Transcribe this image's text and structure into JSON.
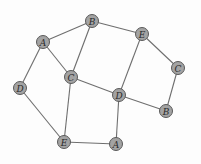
{
  "graph": {
    "nodes": [
      {
        "id": "n1",
        "label": "A",
        "x": 43,
        "y": 42
      },
      {
        "id": "n2",
        "label": "B",
        "x": 92,
        "y": 21
      },
      {
        "id": "n3",
        "label": "E",
        "x": 142,
        "y": 34
      },
      {
        "id": "n4",
        "label": "C",
        "x": 178,
        "y": 68
      },
      {
        "id": "n5",
        "label": "C",
        "x": 71,
        "y": 77
      },
      {
        "id": "n6",
        "label": "D",
        "x": 20,
        "y": 88
      },
      {
        "id": "n7",
        "label": "D",
        "x": 119,
        "y": 95
      },
      {
        "id": "n8",
        "label": "B",
        "x": 166,
        "y": 111
      },
      {
        "id": "n9",
        "label": "E",
        "x": 64,
        "y": 142
      },
      {
        "id": "n10",
        "label": "A",
        "x": 116,
        "y": 144
      }
    ],
    "edges": [
      [
        "n1",
        "n2"
      ],
      [
        "n1",
        "n5"
      ],
      [
        "n1",
        "n6"
      ],
      [
        "n2",
        "n5"
      ],
      [
        "n2",
        "n3"
      ],
      [
        "n3",
        "n4"
      ],
      [
        "n3",
        "n7"
      ],
      [
        "n4",
        "n8"
      ],
      [
        "n5",
        "n7"
      ],
      [
        "n5",
        "n9"
      ],
      [
        "n6",
        "n9"
      ],
      [
        "n7",
        "n8"
      ],
      [
        "n7",
        "n10"
      ],
      [
        "n9",
        "n10"
      ]
    ],
    "node_radius": 6.5,
    "colors": {
      "node_fill": "#a3a3a3",
      "node_stroke": "#5a5a5a",
      "edge": "#6e6e6e"
    }
  }
}
